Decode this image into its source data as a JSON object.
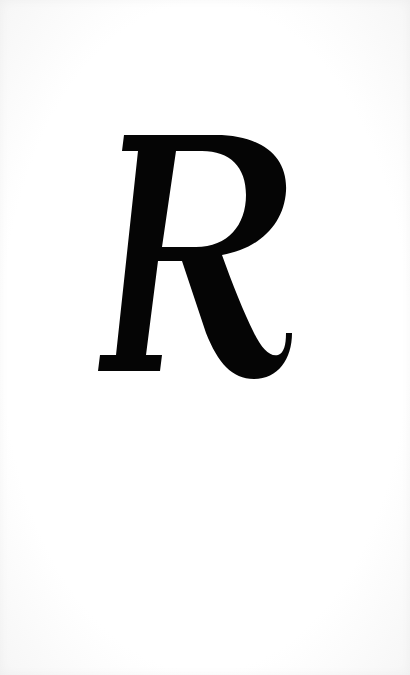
{
  "page": {
    "type": "scanned-page",
    "background_color": "#ffffff",
    "ink_color": "#050505"
  },
  "content": {
    "letter": "R",
    "style": "italic serif capital"
  }
}
